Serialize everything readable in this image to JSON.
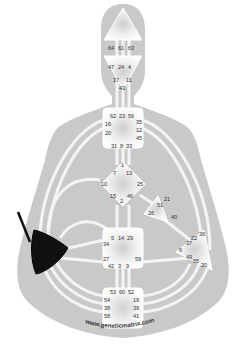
{
  "diagram": {
    "type": "human-design-bodygraph",
    "watermark": "www.geneticmatrix.com",
    "colors": {
      "background": "#ffffff",
      "body_silhouette": "#c9c9c9",
      "channel": "#f4f4f4",
      "center_fill_undefined": "#ffffff",
      "center_fill_defined": "#111111",
      "active_channel": "#111111",
      "gate_text": "#333333"
    },
    "centers": [
      {
        "name": "head",
        "defined": false,
        "gates": [
          "64",
          "61",
          "63"
        ]
      },
      {
        "name": "ajna",
        "defined": false,
        "gates": [
          "47",
          "24",
          "4",
          "17",
          "11",
          "43"
        ]
      },
      {
        "name": "throat",
        "defined": false,
        "gates": [
          "62",
          "23",
          "56",
          "16",
          "35",
          "20",
          "12",
          "45",
          "31",
          "8",
          "33"
        ]
      },
      {
        "name": "g-center",
        "defined": false,
        "gates": [
          "1",
          "7",
          "13",
          "10",
          "25",
          "15",
          "2",
          "46"
        ]
      },
      {
        "name": "heart",
        "defined": false,
        "gates": [
          "21",
          "51",
          "26",
          "40"
        ]
      },
      {
        "name": "spleen",
        "defined": true,
        "gates": [
          "48",
          "57",
          "44",
          "50",
          "32",
          "28",
          "18"
        ]
      },
      {
        "name": "solar-plexus",
        "defined": false,
        "gates": [
          "36",
          "22",
          "37",
          "6",
          "49",
          "55",
          "30"
        ]
      },
      {
        "name": "sacral",
        "defined": false,
        "gates": [
          "5",
          "14",
          "29",
          "34",
          "27",
          "59",
          "42",
          "3",
          "9"
        ]
      },
      {
        "name": "root",
        "defined": false,
        "gates": [
          "53",
          "60",
          "52",
          "54",
          "19",
          "38",
          "39",
          "58",
          "41"
        ]
      }
    ],
    "active_channel_segments": [
      {
        "from_center": "spleen",
        "direction": "up",
        "note": "single black channel line rising from spleen"
      }
    ],
    "labels": {
      "head": {
        "g64": "64",
        "g61": "61",
        "g63": "63"
      },
      "ajna": {
        "g47": "47",
        "g24": "24",
        "g4": "4",
        "g17": "17",
        "g11": "11",
        "g43": "43"
      },
      "throat": {
        "g62": "62",
        "g23": "23",
        "g56": "56",
        "g16": "16",
        "g35": "35",
        "g20": "20",
        "g12": "12",
        "g45": "45",
        "g31": "31",
        "g8": "8",
        "g33": "33"
      },
      "g": {
        "g1": "1",
        "g7": "7",
        "g13": "13",
        "g10": "10",
        "g25": "25",
        "g15": "15",
        "g2": "2",
        "g46": "46"
      },
      "heart": {
        "g21": "21",
        "g51": "51",
        "g26": "26",
        "g40": "40"
      },
      "solar": {
        "g36": "36",
        "g22": "22",
        "g37": "37",
        "g6": "6",
        "g49": "49",
        "g55": "55",
        "g30": "30"
      },
      "sacral": {
        "g5": "5",
        "g14": "14",
        "g29": "29",
        "g34": "34",
        "g27": "27",
        "g59": "59",
        "g42": "42",
        "g3": "3",
        "g9": "9"
      },
      "root": {
        "g53": "53",
        "g60": "60",
        "g52": "52",
        "g54": "54",
        "g19": "19",
        "g38": "38",
        "g39": "39",
        "g58": "58",
        "g41": "41"
      }
    }
  }
}
